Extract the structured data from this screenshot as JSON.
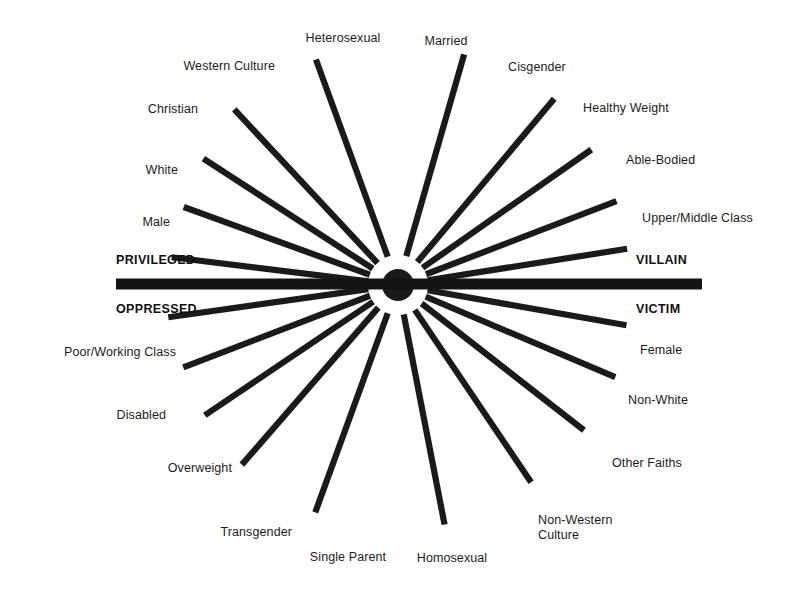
{
  "diagram": {
    "background_color": "#ffffff",
    "ray_color": "#1a1a1a",
    "text_color": "#1c1c1c",
    "center": {
      "x": 398,
      "y": 285
    },
    "axis_bar": {
      "x_start": 116,
      "x_end": 702,
      "y": 284,
      "thickness": 11,
      "color": "#141414"
    },
    "axis_labels": {
      "top_left": "PRIVILEGED",
      "top_right": "VILLAIN",
      "bottom_left": "OPPRESSED",
      "bottom_right": "VICTIM"
    },
    "axis_label_positions": {
      "top_left": {
        "x": 116,
        "y": 260,
        "anchor": "left"
      },
      "top_right": {
        "x": 636,
        "y": 260,
        "anchor": "left"
      },
      "bottom_left": {
        "x": 116,
        "y": 309,
        "anchor": "left"
      },
      "bottom_right": {
        "x": 636,
        "y": 309,
        "anchor": "left"
      }
    },
    "upper_rays": [
      {
        "label": "Male",
        "side": "left",
        "inner_r": 30,
        "outer_r": 228,
        "angle_deg": 173.0,
        "label_x": 170,
        "label_y": 222,
        "anchor": "right"
      },
      {
        "label": "White",
        "side": "left",
        "inner_r": 30,
        "outer_r": 228,
        "angle_deg": 160.0,
        "label_x": 178,
        "label_y": 170,
        "anchor": "right"
      },
      {
        "label": "Christian",
        "side": "left",
        "inner_r": 30,
        "outer_r": 232,
        "angle_deg": 147.0,
        "label_x": 198,
        "label_y": 109,
        "anchor": "right"
      },
      {
        "label": "Western Culture",
        "side": "left",
        "inner_r": 30,
        "outer_r": 240,
        "angle_deg": 133.0,
        "label_x": 275,
        "label_y": 66,
        "anchor": "right"
      },
      {
        "label": "Heterosexual",
        "side": "left",
        "inner_r": 30,
        "outer_r": 240,
        "angle_deg": 110.0,
        "label_x": 343,
        "label_y": 38,
        "anchor": "center"
      },
      {
        "label": "Married",
        "side": "right",
        "inner_r": 30,
        "outer_r": 240,
        "angle_deg": 74.0,
        "label_x": 446,
        "label_y": 41,
        "anchor": "center"
      },
      {
        "label": "Cisgender",
        "side": "right",
        "inner_r": 30,
        "outer_r": 243,
        "angle_deg": 50.0,
        "label_x": 508,
        "label_y": 67,
        "anchor": "left"
      },
      {
        "label": "Healthy Weight",
        "side": "right",
        "inner_r": 30,
        "outer_r": 236,
        "angle_deg": 35.0,
        "label_x": 583,
        "label_y": 108,
        "anchor": "left"
      },
      {
        "label": "Able-Bodied",
        "side": "right",
        "inner_r": 30,
        "outer_r": 234,
        "angle_deg": 21.0,
        "label_x": 626,
        "label_y": 160,
        "anchor": "left"
      },
      {
        "label": "Upper/Middle Class",
        "side": "right",
        "inner_r": 30,
        "outer_r": 232,
        "angle_deg": 9.0,
        "label_x": 642,
        "label_y": 218,
        "anchor": "left"
      }
    ],
    "lower_rays": [
      {
        "label": "Poor/Working Class",
        "side": "left",
        "inner_r": 30,
        "outer_r": 232,
        "angle_deg": -172.0,
        "label_x": 176,
        "label_y": 352,
        "anchor": "right"
      },
      {
        "label": "Disabled",
        "side": "left",
        "inner_r": 30,
        "outer_r": 230,
        "angle_deg": -159.0,
        "label_x": 166,
        "label_y": 415,
        "anchor": "right"
      },
      {
        "label": "Overweight",
        "side": "left",
        "inner_r": 30,
        "outer_r": 233,
        "angle_deg": -146.0,
        "label_x": 232,
        "label_y": 468,
        "anchor": "right"
      },
      {
        "label": "Transgender",
        "side": "left",
        "inner_r": 30,
        "outer_r": 238,
        "angle_deg": -131.0,
        "label_x": 292,
        "label_y": 532,
        "anchor": "right"
      },
      {
        "label": "Single Parent",
        "side": "left",
        "inner_r": 30,
        "outer_r": 242,
        "angle_deg": -110.0,
        "label_x": 348,
        "label_y": 557,
        "anchor": "center"
      },
      {
        "label": "Homosexual",
        "side": "right",
        "inner_r": 30,
        "outer_r": 244,
        "angle_deg": -79.0,
        "label_x": 452,
        "label_y": 558,
        "anchor": "center"
      },
      {
        "label": "Non-Western\nCulture",
        "side": "right",
        "inner_r": 30,
        "outer_r": 238,
        "angle_deg": -56.0,
        "label_x": 538,
        "label_y": 528,
        "anchor": "left"
      },
      {
        "label": "Other Faiths",
        "side": "right",
        "inner_r": 30,
        "outer_r": 236,
        "angle_deg": -38.0,
        "label_x": 612,
        "label_y": 463,
        "anchor": "left"
      },
      {
        "label": "Non-White",
        "side": "right",
        "inner_r": 30,
        "outer_r": 236,
        "angle_deg": -23.0,
        "label_x": 628,
        "label_y": 400,
        "anchor": "left"
      },
      {
        "label": "Female",
        "side": "right",
        "inner_r": 30,
        "outer_r": 232,
        "angle_deg": -10.0,
        "label_x": 640,
        "label_y": 350,
        "anchor": "left"
      }
    ]
  }
}
